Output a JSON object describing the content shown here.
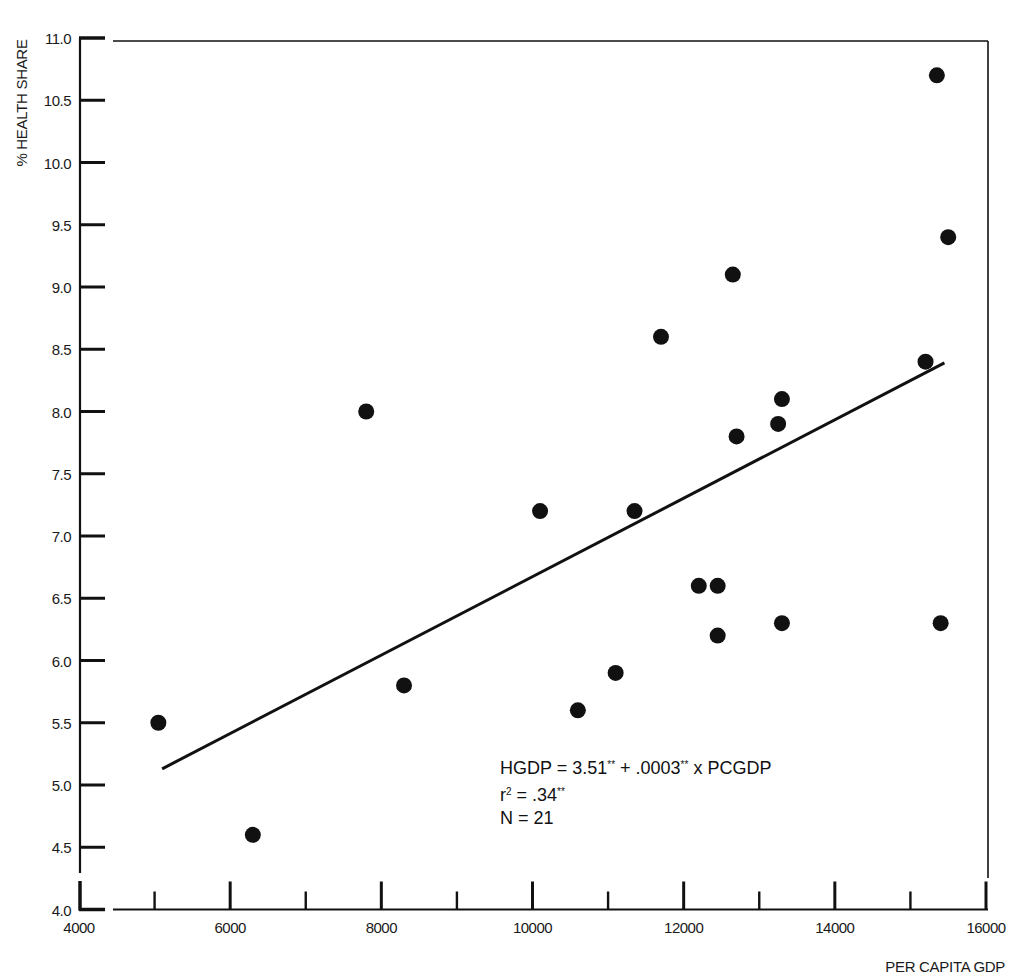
{
  "chart_data": {
    "type": "scatter",
    "title": "",
    "xlabel": "PER CAPITA GDP",
    "ylabel": "% HEALTH SHARE",
    "xlim": [
      4000,
      16000
    ],
    "ylim": [
      4.0,
      11.0
    ],
    "grid": false,
    "legend": null,
    "x_ticks": [
      4000,
      6000,
      8000,
      10000,
      12000,
      14000,
      16000
    ],
    "x_tick_labels": [
      "4000",
      "6000",
      "8000",
      "10000",
      "12000",
      "14000",
      "16000"
    ],
    "x_minor_ticks": [
      5000,
      7000,
      9000,
      11000,
      13000,
      15000
    ],
    "y_ticks": [
      4.0,
      4.5,
      5.0,
      5.5,
      6.0,
      6.5,
      7.0,
      7.5,
      8.0,
      8.5,
      9.0,
      9.5,
      10.0,
      10.5,
      11.0
    ],
    "y_tick_labels": [
      "4.0",
      "4.5",
      "5.0",
      "5.5",
      "6.0",
      "6.5",
      "7.0",
      "7.5",
      "8.0",
      "8.5",
      "9.0",
      "9.5",
      "10.0",
      "10.5",
      "11.0"
    ],
    "axis_break": "y-axis broken between 4.0 and 4.5",
    "series": [
      {
        "name": "Countries",
        "marker": "filled-circle",
        "color": "#111111",
        "points": [
          {
            "x": 5050,
            "y": 5.5
          },
          {
            "x": 6300,
            "y": 4.6
          },
          {
            "x": 7800,
            "y": 8.0
          },
          {
            "x": 8300,
            "y": 5.8
          },
          {
            "x": 10100,
            "y": 7.2
          },
          {
            "x": 10600,
            "y": 5.6
          },
          {
            "x": 11100,
            "y": 5.9
          },
          {
            "x": 11350,
            "y": 7.2
          },
          {
            "x": 11700,
            "y": 8.6
          },
          {
            "x": 12200,
            "y": 6.6
          },
          {
            "x": 12450,
            "y": 6.6
          },
          {
            "x": 12450,
            "y": 6.2
          },
          {
            "x": 12650,
            "y": 9.1
          },
          {
            "x": 12700,
            "y": 7.8
          },
          {
            "x": 13250,
            "y": 7.9
          },
          {
            "x": 13300,
            "y": 8.1
          },
          {
            "x": 13300,
            "y": 6.3
          },
          {
            "x": 15200,
            "y": 8.4
          },
          {
            "x": 15350,
            "y": 10.7
          },
          {
            "x": 15400,
            "y": 6.3
          },
          {
            "x": 15500,
            "y": 9.4
          }
        ]
      }
    ],
    "regression_line": {
      "intercept": 3.51,
      "slope": 0.0003,
      "x_start": 5100,
      "x_end": 15450,
      "y_start": 5.13,
      "y_end": 8.39
    },
    "annotations": [
      {
        "text": "HGDP = 3.51** + .0003** x PCGDP"
      },
      {
        "text": "r² = .34**"
      },
      {
        "text": "N = 21"
      }
    ]
  },
  "annotation": {
    "equation_prefix": "HGDP = 3.51",
    "equation_sig1": "**",
    "equation_mid": " + .0003",
    "equation_sig2": "**",
    "equation_suffix": " x PCGDP",
    "r2_prefix": "r",
    "r2_sup": "2",
    "r2_mid": " = .34",
    "r2_sig": "**",
    "n_line": "N = 21"
  }
}
